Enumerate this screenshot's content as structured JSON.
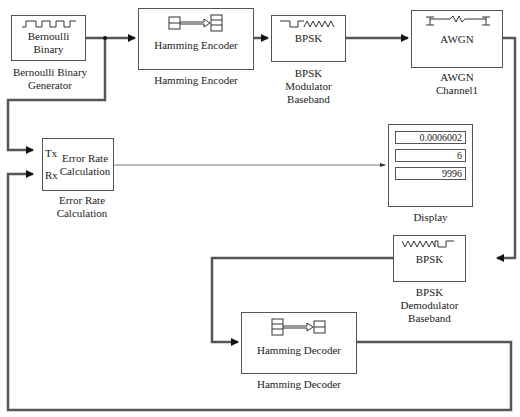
{
  "blocks": {
    "bernoulli": {
      "inner": [
        "Bernoulli",
        "Binary"
      ],
      "caption": [
        "Bernoulli Binary",
        "Generator"
      ],
      "icon": "square-wave-icon"
    },
    "hamming_encoder": {
      "inner": "Hamming Encoder",
      "caption": "Hamming Encoder",
      "icon": "encoder-icon"
    },
    "bpsk_mod": {
      "inner": "BPSK",
      "caption": [
        "BPSK",
        "Modulator",
        "Baseband"
      ],
      "icon": "square-to-sine-icon"
    },
    "awgn": {
      "inner": "AWGN",
      "caption": [
        "AWGN",
        "Channel1"
      ],
      "icon": "channel-resistor-icon"
    },
    "error_rate": {
      "inner": [
        "Error Rate",
        "Calculation"
      ],
      "ports": [
        "Tx",
        "Rx"
      ],
      "caption": [
        "Error Rate",
        "Calculation"
      ]
    },
    "display": {
      "values": [
        "0.0006002",
        "6",
        "9996"
      ],
      "caption": "Display"
    },
    "bpsk_demod": {
      "inner": "BPSK",
      "caption": [
        "BPSK",
        "Demodulator",
        "Baseband"
      ],
      "icon": "sine-to-square-icon"
    },
    "hamming_decoder": {
      "inner": "Hamming Decoder",
      "caption": "Hamming Decoder",
      "icon": "decoder-icon"
    }
  },
  "colors": {
    "wire": "#555555",
    "border": "#555555",
    "background": "#ffffff"
  }
}
